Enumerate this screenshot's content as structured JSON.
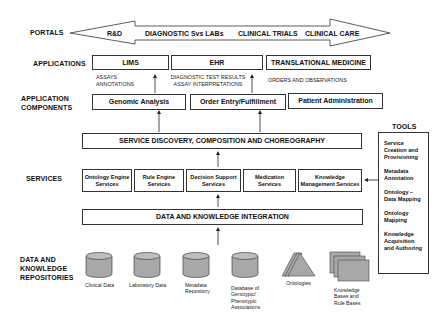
{
  "layers": {
    "portals": "PORTALS",
    "applications": "APPLICATIONS",
    "application_components": [
      "APPLICATION",
      "COMPONENTS"
    ],
    "services": "SERVICES",
    "repositories": [
      "DATA AND",
      "KNOWLEDGE",
      "REPOSITORIES"
    ]
  },
  "portals": [
    "R&D",
    "DIAGNOSTIC Svs LABs",
    "CLINICAL TRIALS",
    "CLINICAL CARE"
  ],
  "applications": [
    "LIMS",
    "EHR",
    "TRANSLATIONAL MEDICINE"
  ],
  "app_notes": {
    "lims": [
      "ASSAYS",
      "ANNOTATIONS"
    ],
    "ehr": [
      "DIAGNOSTIC TEST RESULTS",
      "ASSAY INTERPRETATIONS"
    ],
    "translational": [
      "ORDERS AND OBSERVATIONS"
    ]
  },
  "components": [
    "Genomic Analysis",
    "Order Entry/Fulfillment",
    "Patient Administration"
  ],
  "service_discovery": "SERVICE DISCOVERY, COMPOSITION AND CHOREOGRAPHY",
  "services": [
    [
      "Ontology Engine",
      "Services"
    ],
    [
      "Rule Engine",
      "Services"
    ],
    [
      "Decision Support",
      "Services"
    ],
    [
      "Medication",
      "Services"
    ],
    [
      "Knowledge",
      "Management Services"
    ]
  ],
  "integration": "DATA AND KNOWLEDGE INTEGRATION",
  "repositories": [
    {
      "icon": "cylinder",
      "caption": [
        "Clinical Data"
      ]
    },
    {
      "icon": "cylinder",
      "caption": [
        "Laboratory Data"
      ]
    },
    {
      "icon": "cylinder",
      "caption": [
        "Metadata",
        "Repository"
      ]
    },
    {
      "icon": "cylinder",
      "caption": [
        "Database of",
        "Genotypic/",
        "Phenotypic",
        "Associations"
      ]
    },
    {
      "icon": "triangles",
      "caption": [
        "Ontologies"
      ]
    },
    {
      "icon": "stacked-pages",
      "caption": [
        "Knowledge",
        "Bases and",
        "Rule Bases"
      ]
    }
  ],
  "tools": {
    "title": "TOOLS",
    "items": [
      [
        "Service",
        "Creation and",
        "Provisioning"
      ],
      [
        "Metadata",
        "Annotation"
      ],
      [
        "Ontology –",
        "Data Mapping"
      ],
      [
        "Ontology",
        "Mapping"
      ],
      [
        "Knowledge",
        "Acquisition",
        "and Authoring"
      ]
    ]
  },
  "colors": {
    "line": "#333333",
    "fill_gray": "#a8a8a8",
    "background": "#ffffff"
  }
}
